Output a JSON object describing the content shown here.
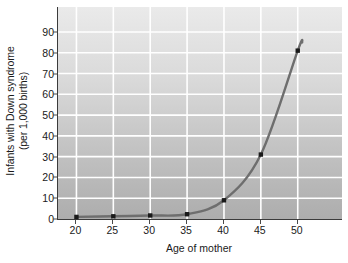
{
  "chart_data": {
    "type": "line",
    "title": "",
    "subtitle": "",
    "xlabel": "Age of mother",
    "ylabel": "Infants with Down syndrome (per 1,000 births)",
    "ylabel_line1": "Infants with Down syndrome",
    "ylabel_line2": "(per 1,000 births)",
    "x": [
      20,
      25,
      30,
      35,
      40,
      45,
      50
    ],
    "values": [
      1,
      1.3,
      1.7,
      2.3,
      9,
      31,
      81
    ],
    "series": [
      {
        "name": "Infants with Down syndrome per 1,000 births",
        "values": [
          1,
          1.3,
          1.7,
          2.3,
          9,
          31,
          81
        ]
      }
    ],
    "xtick_labels": [
      "20",
      "25",
      "30",
      "35",
      "40",
      "45",
      "50"
    ],
    "ytick_labels": [
      "0",
      "10",
      "20",
      "30",
      "40",
      "50",
      "60",
      "70",
      "80",
      "90"
    ],
    "xticks": [
      20,
      25,
      30,
      35,
      40,
      45,
      50
    ],
    "yticks": [
      0,
      10,
      20,
      30,
      40,
      50,
      60,
      70,
      80,
      90
    ],
    "xlim": [
      17.5,
      56
    ],
    "ylim": [
      0,
      102
    ],
    "grid": true,
    "grid_color": "#ffffff",
    "legend": false,
    "legend_position": "none",
    "markers": true,
    "marker_color": "#1a1a1a",
    "line_color": "#6e6e6e",
    "plot_bg_top": "#eaeaea",
    "plot_bg_bottom": "#adadad",
    "axis_color": "#3b3b3b",
    "text_color": "#1a1a1a",
    "curve_end_value": 85,
    "curve_end_x": 50.6
  }
}
